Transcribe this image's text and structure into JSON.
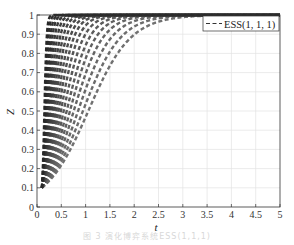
{
  "chart_data": {
    "type": "line",
    "title": "",
    "xlabel": "t",
    "ylabel": "Z",
    "xlim": [
      0,
      5
    ],
    "ylim": [
      0,
      1
    ],
    "xticks": [
      "0",
      "0.5",
      "1",
      "1.5",
      "2",
      "2.5",
      "3",
      "3.5",
      "4",
      "4.5",
      "5"
    ],
    "yticks": [
      "0",
      "0.1",
      "0.2",
      "0.3",
      "0.4",
      "0.5",
      "0.6",
      "0.7",
      "0.8",
      "0.9",
      "1"
    ],
    "grid": true,
    "legend": {
      "position": "upper right",
      "entries": [
        "ESS(1, 1, 1)"
      ]
    },
    "line_style": "dashed",
    "line_color": "#333333",
    "series_model": "Z(t) = 1 / (1 + 9*exp(-r*(t - 0.1)))",
    "series": [
      {
        "name": "trajectory-1",
        "r": 2.3
      },
      {
        "name": "trajectory-2",
        "r": 2.6
      },
      {
        "name": "trajectory-3",
        "r": 2.95
      },
      {
        "name": "trajectory-4",
        "r": 3.35
      },
      {
        "name": "trajectory-5",
        "r": 3.8
      },
      {
        "name": "trajectory-6",
        "r": 4.3
      },
      {
        "name": "trajectory-7",
        "r": 4.9
      },
      {
        "name": "trajectory-8",
        "r": 5.6
      },
      {
        "name": "trajectory-9",
        "r": 6.4
      },
      {
        "name": "trajectory-10",
        "r": 7.3
      },
      {
        "name": "trajectory-11",
        "r": 8.4
      },
      {
        "name": "trajectory-12",
        "r": 9.7
      },
      {
        "name": "trajectory-13",
        "r": 11.3
      },
      {
        "name": "trajectory-14",
        "r": 13.3
      },
      {
        "name": "trajectory-15",
        "r": 16
      },
      {
        "name": "trajectory-16",
        "r": 19.5
      },
      {
        "name": "trajectory-17",
        "r": 24
      },
      {
        "name": "trajectory-18",
        "r": 31
      },
      {
        "name": "trajectory-19",
        "r": 42
      }
    ],
    "sample_points": {
      "slowest": [
        [
          0.1,
          0.1
        ],
        [
          0.5,
          0.22
        ],
        [
          1.05,
          0.5
        ],
        [
          1.5,
          0.73
        ],
        [
          2.3,
          0.95
        ],
        [
          3.5,
          1.0
        ]
      ],
      "fastest": [
        [
          0.1,
          0.1
        ],
        [
          0.15,
          0.45
        ],
        [
          0.2,
          0.9
        ],
        [
          0.3,
          1.0
        ]
      ]
    }
  },
  "caption": "图 3  演化博弈系统ESS(1,1,1)"
}
